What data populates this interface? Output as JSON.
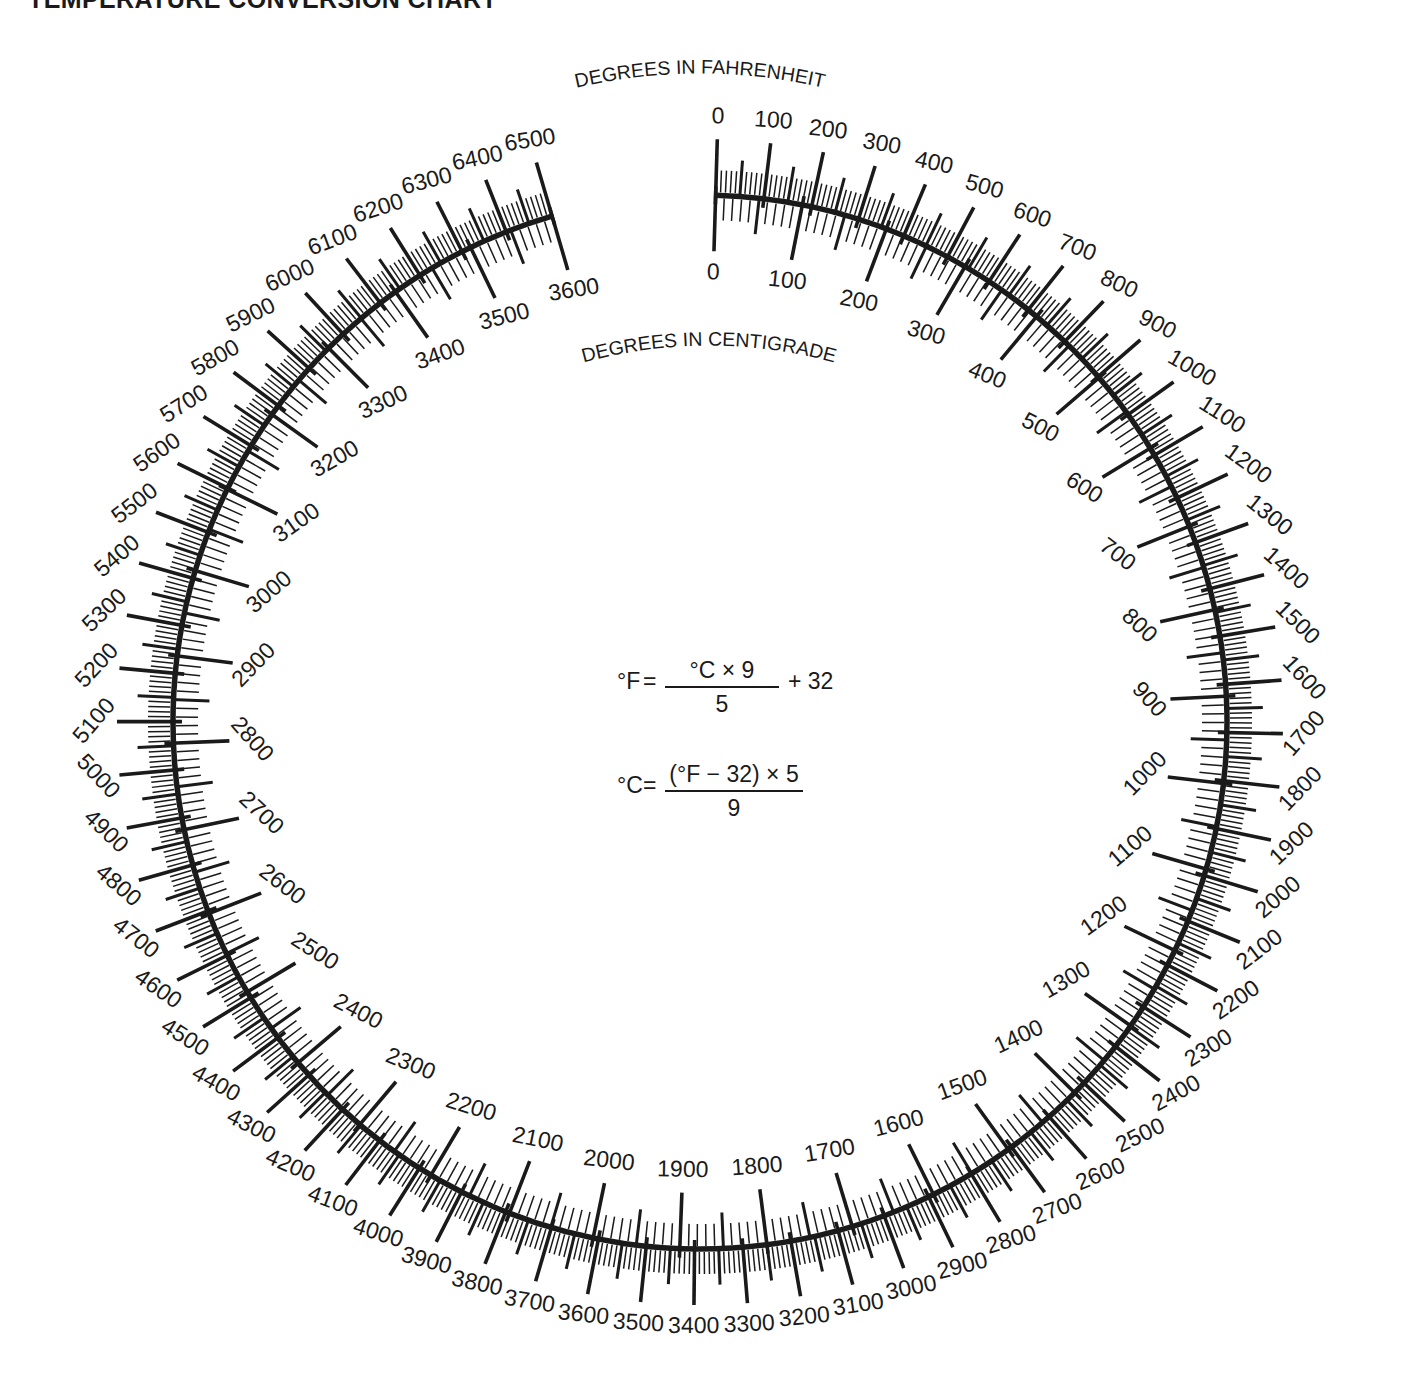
{
  "page": {
    "title": "TEMPERATURE CONVERSION CHART",
    "background_color": "#ffffff",
    "ink_color": "#1a1a1a"
  },
  "labels": {
    "fahrenheit_arc_label": "DEGREES IN FAHRENHEIT",
    "centigrade_arc_label": "DEGREES IN CENTIGRADE"
  },
  "formulas": {
    "f_from_c": {
      "lhs": "°F",
      "equals": "=",
      "numerator": "°C × 9",
      "denominator": "5",
      "tail": "+ 32"
    },
    "c_from_f": {
      "lhs": "°C",
      "equals": "=",
      "numerator": "(°F − 32) × 5",
      "denominator": "9",
      "tail": ""
    }
  },
  "chart_data": {
    "type": "line",
    "title": "TEMPERATURE CONVERSION CHART",
    "subtitle": "Circular dual-scale nomogram",
    "xlabel": "DEGREES IN CENTIGRADE",
    "ylabel": "DEGREES IN FAHRENHEIT",
    "grid": false,
    "legend_position": "none",
    "relation": "°F = °C × 9 / 5 + 32",
    "geometry": {
      "center_x": 700,
      "center_y": 722,
      "radius": 527,
      "start_angle_deg": -88.3,
      "sweep_deg": 342,
      "direction": "clockwise"
    },
    "series": [
      {
        "name": "DEGREES IN FAHRENHEIT",
        "side": "outer",
        "min": 0,
        "max": 6500,
        "major_step": 100,
        "medium_step": 50,
        "minor_step": 10,
        "ticks": [
          0,
          100,
          200,
          300,
          400,
          500,
          600,
          700,
          800,
          900,
          1000,
          1100,
          1200,
          1300,
          1400,
          1500,
          1600,
          1700,
          1800,
          1900,
          2000,
          2100,
          2200,
          2300,
          2400,
          2500,
          2600,
          2700,
          2800,
          2900,
          3000,
          3100,
          3200,
          3300,
          3400,
          3500,
          3600,
          3700,
          3800,
          3900,
          4000,
          4100,
          4200,
          4300,
          4400,
          4500,
          4600,
          4700,
          4800,
          4900,
          5000,
          5100,
          5200,
          5300,
          5400,
          5500,
          5600,
          5700,
          5800,
          5900,
          6000,
          6100,
          6200,
          6300,
          6400,
          6500
        ],
        "labels": [
          "0",
          "100",
          "200",
          "300",
          "400",
          "500",
          "600",
          "700",
          "800",
          "900",
          "1000",
          "1100",
          "1200",
          "1300",
          "1400",
          "1500",
          "1600",
          "1700",
          "1800",
          "1900",
          "2000",
          "2100",
          "2200",
          "2300",
          "2400",
          "2500",
          "2600",
          "2700",
          "2800",
          "2900",
          "3000",
          "3100",
          "3200",
          "3300",
          "3400",
          "3500",
          "3600",
          "3700",
          "3800",
          "3900",
          "4000",
          "4100",
          "4200",
          "4300",
          "4400",
          "4500",
          "4600",
          "4700",
          "4800",
          "4900",
          "5000",
          "5100",
          "5200",
          "5300",
          "5400",
          "5500",
          "5600",
          "5700",
          "5800",
          "5900",
          "6000",
          "6100",
          "6200",
          "6300",
          "6400",
          "6500"
        ]
      },
      {
        "name": "DEGREES IN CENTIGRADE",
        "side": "inner",
        "min": 0,
        "max": 3600,
        "major_step": 100,
        "medium_step": 50,
        "minor_step": 10,
        "ticks": [
          0,
          100,
          200,
          300,
          400,
          500,
          600,
          700,
          800,
          900,
          1000,
          1100,
          1200,
          1300,
          1400,
          1500,
          1600,
          1700,
          1800,
          1900,
          2000,
          2100,
          2200,
          2300,
          2400,
          2500,
          2600,
          2700,
          2800,
          2900,
          3000,
          3100,
          3200,
          3300,
          3400,
          3500,
          3600
        ],
        "labels": [
          "0",
          "100",
          "200",
          "300",
          "400",
          "500",
          "600",
          "700",
          "800",
          "900",
          "1000",
          "1100",
          "1200",
          "1300",
          "1400",
          "1500",
          "1600",
          "1700",
          "1800",
          "1900",
          "2000",
          "2100",
          "2200",
          "2300",
          "2400",
          "2500",
          "2600",
          "2700",
          "2800",
          "2900",
          "3000",
          "3100",
          "3200",
          "3300",
          "3400",
          "3500",
          "3600"
        ]
      }
    ],
    "anchor_pairs": [
      {
        "c": 0,
        "f": 0
      },
      {
        "c": 3600,
        "f": 6500
      }
    ]
  }
}
